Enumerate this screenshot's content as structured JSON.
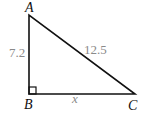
{
  "diagram": {
    "type": "right-triangle",
    "vertices": {
      "A": {
        "label": "A",
        "x": 29,
        "y": 15
      },
      "B": {
        "label": "B",
        "x": 29,
        "y": 94
      },
      "C": {
        "label": "C",
        "x": 135,
        "y": 94
      }
    },
    "right_angle_at": "B",
    "sides": {
      "AB": {
        "label": "7.2"
      },
      "AC": {
        "label": "12.5"
      },
      "BC": {
        "label": "x"
      }
    },
    "colors": {
      "stroke": "#111111",
      "measure_text": "#8a8a8a",
      "vertex_text": "#111111"
    }
  }
}
